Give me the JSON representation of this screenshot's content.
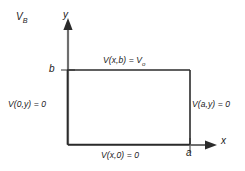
{
  "figure": {
    "title_label": "V",
    "title_sub": "B",
    "axes": {
      "x_label": "x",
      "y_label": "y"
    },
    "ticks": {
      "y_tick": "b",
      "x_tick": "a"
    },
    "boundary_conditions": {
      "top": {
        "text": "V(x,b) = V",
        "sub": "o"
      },
      "left": {
        "text": "V(0,y) = 0",
        "sub": ""
      },
      "right": {
        "text": "V(a,y) = 0",
        "sub": ""
      },
      "bottom": {
        "text": "V(x,0) = 0",
        "sub": ""
      }
    },
    "colors": {
      "stroke": "#3a3a3a",
      "text": "#1a1a1a",
      "background": "#ffffff"
    }
  }
}
